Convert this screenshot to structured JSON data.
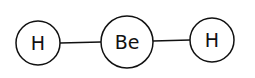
{
  "molecule": {
    "atoms": [
      {
        "id": "h1",
        "symbol": "H",
        "cx": 38,
        "cy": 43,
        "r": 22
      },
      {
        "id": "be",
        "symbol": "Be",
        "cx": 127,
        "cy": 42,
        "r": 26
      },
      {
        "id": "h2",
        "symbol": "H",
        "cx": 212,
        "cy": 40,
        "r": 22
      }
    ],
    "bonds": [
      {
        "from": "h1",
        "to": "be"
      },
      {
        "from": "be",
        "to": "h2"
      }
    ]
  },
  "colors": {
    "stroke": "#111111",
    "background": "#ffffff"
  }
}
